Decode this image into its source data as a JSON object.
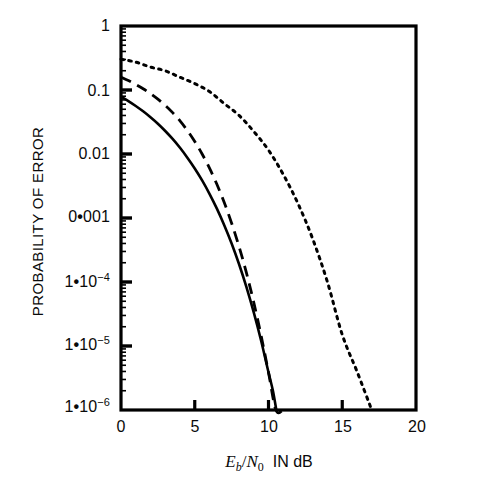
{
  "chart_data": {
    "type": "line",
    "title": "",
    "xlabel": "Eb/N0 IN dB",
    "ylabel": "PROBABILITY OF ERROR",
    "xlim": [
      0,
      20
    ],
    "ylim": [
      1e-06,
      1
    ],
    "yscale": "log",
    "grid": false,
    "legend": "none",
    "xticks": [
      0,
      5,
      10,
      15,
      20
    ],
    "xtick_labels": [
      "0",
      "5",
      "10",
      "15",
      "20"
    ],
    "yticks": [
      1,
      0.1,
      0.01,
      0.001,
      0.0001,
      1e-05,
      1e-06
    ],
    "ytick_labels": [
      "1",
      "0.1",
      "0.01",
      "0• 001",
      "1•10⁻⁴",
      "1•10⁻⁵",
      "1•10⁻⁶"
    ],
    "series": [
      {
        "name": "solid-curve",
        "style": "solid",
        "color": "#000000",
        "x": [
          0,
          0.5,
          1,
          1.5,
          2,
          2.5,
          3,
          3.5,
          4,
          4.5,
          5,
          5.5,
          6,
          6.5,
          7,
          7.5,
          8,
          8.5,
          9,
          9.5,
          10,
          10.3,
          10.53
        ],
        "y": [
          0.0786,
          0.0671,
          0.0563,
          0.0464,
          0.0375,
          0.0297,
          0.0229,
          0.0172,
          0.0125,
          0.00875,
          0.00595,
          0.00387,
          0.00239,
          0.0014,
          0.000773,
          0.0004,
          0.000191,
          8.4e-05,
          3.36e-05,
          1.21e-05,
          3.87e-06,
          2e-06,
          1e-06
        ]
      },
      {
        "name": "dashed-curve",
        "style": "dashed",
        "color": "#000000",
        "x": [
          0,
          0.5,
          1,
          1.5,
          2,
          2.5,
          3,
          3.5,
          4,
          4.5,
          5,
          5.5,
          6,
          6.5,
          7,
          7.5,
          8,
          8.5,
          9,
          9.5,
          10,
          10.5,
          11,
          11.2
        ],
        "y": [
          0.1587,
          0.1403,
          0.1222,
          0.1047,
          0.0878,
          0.072,
          0.0574,
          0.0443,
          0.0329,
          0.0233,
          0.0157,
          0.01,
          0.006,
          0.00336,
          0.00174,
          0.00083,
          0.00036,
          0.00014,
          4.8e-05,
          1.45e-05,
          3.87e-06,
          8.8e-07,
          1.9e-07,
          1e-06
        ]
      },
      {
        "name": "dotted-curve",
        "style": "dotted",
        "color": "#000000",
        "x": [
          0,
          1,
          2,
          3,
          4,
          5,
          6,
          7,
          8,
          9,
          10,
          11,
          12,
          13,
          14,
          15,
          16,
          17
        ],
        "y": [
          0.3033,
          0.2725,
          0.2285,
          0.1992,
          0.158,
          0.1257,
          0.0946,
          0.0613,
          0.0402,
          0.0225,
          0.0115,
          0.0048,
          0.00168,
          0.00047,
          9.9e-05,
          1.5e-05,
          4e-06,
          1e-06
        ]
      }
    ]
  },
  "axes": {
    "y_title": "PROBABILITY OF ERROR",
    "x_title_parts": {
      "e_symbol": "E",
      "e_sub": "b",
      "slash": "/",
      "n_symbol": "N",
      "n_sub": "0",
      "units": "IN dB"
    },
    "x_tick_labels": [
      "0",
      "5",
      "10",
      "15",
      "20"
    ],
    "y_tick_labels": [
      {
        "text": "1",
        "kind": "plain"
      },
      {
        "text": "0.1",
        "kind": "plain"
      },
      {
        "text": "0.01",
        "kind": "plain"
      },
      {
        "mantissa": "0",
        "sep": "•",
        "rest": "001",
        "kind": "artifact"
      },
      {
        "mantissa": "1",
        "sep": "•",
        "base": "10",
        "exp": "−4",
        "kind": "sci"
      },
      {
        "mantissa": "1",
        "sep": "•",
        "base": "10",
        "exp": "−5",
        "kind": "sci"
      },
      {
        "mantissa": "1",
        "sep": "•",
        "base": "10",
        "exp": "−6",
        "kind": "sci"
      }
    ]
  },
  "style": {
    "ink": "#0a0a0a",
    "background": "#ffffff",
    "frame_color": "#000000"
  }
}
